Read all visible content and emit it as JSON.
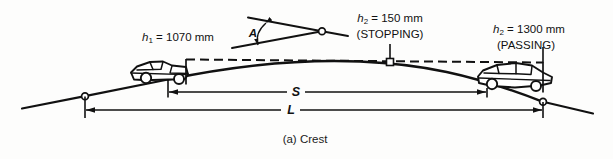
{
  "figure": {
    "caption": "(a) Crest",
    "labels": {
      "driver_eye_height": {
        "symbol": "h",
        "subscript": "1",
        "equals_value": " = 1070 mm",
        "full_text": "h1 = 1070 mm"
      },
      "object_height_stopping": {
        "symbol": "h",
        "subscript": "2",
        "equals_value": " = 150 mm",
        "qualifier": "(STOPPING)",
        "full_text": "h2 = 150 mm (STOPPING)"
      },
      "object_height_passing": {
        "symbol": "h",
        "subscript": "2",
        "equals_value": " = 1300 mm",
        "qualifier": "(PASSING)",
        "full_text": "h2 = 1300 mm (PASSING)"
      },
      "angle": "A",
      "sight_distance": "S",
      "curve_length": "L"
    },
    "colors": {
      "ink": "#111111",
      "background": "#fdfdfc",
      "roadway": "#111111",
      "sight_line": "#111111"
    },
    "elements": {
      "left_vehicle": "pickup-truck-facing-right",
      "right_vehicle": "sedan-facing-left",
      "grade_break_markers": "open-circles",
      "sight_line_style": "dashed",
      "vertical_curve_type": "crest"
    }
  }
}
